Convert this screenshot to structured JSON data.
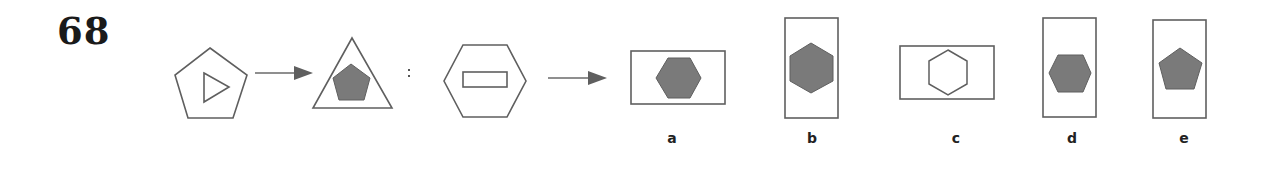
{
  "question": {
    "number": "68",
    "separator": ":"
  },
  "colors": {
    "stroke": "#5f5f5f",
    "fill": "#7a7a7a",
    "background": "#ffffff"
  },
  "analogy": {
    "source": {
      "outer": "pentagon",
      "inner": "triangle (outline, pointing right)"
    },
    "source_result": {
      "outer": "triangle",
      "inner": "pentagon (filled)"
    },
    "target": {
      "outer": "hexagon",
      "inner": "rectangle (outline, horizontal)"
    }
  },
  "options": [
    {
      "label": "a",
      "outer": "rectangle (horizontal)",
      "inner": "hexagon (filled, flat-top)"
    },
    {
      "label": "b",
      "outer": "rectangle (vertical)",
      "inner": "hexagon (filled, pointy-top)"
    },
    {
      "label": "c",
      "outer": "rectangle (horizontal)",
      "inner": "hexagon (outline, pointy-top)"
    },
    {
      "label": "d",
      "outer": "rectangle (vertical)",
      "inner": "hexagon (filled, flat-top)"
    },
    {
      "label": "e",
      "outer": "rectangle (vertical)",
      "inner": "pentagon (filled)"
    }
  ]
}
